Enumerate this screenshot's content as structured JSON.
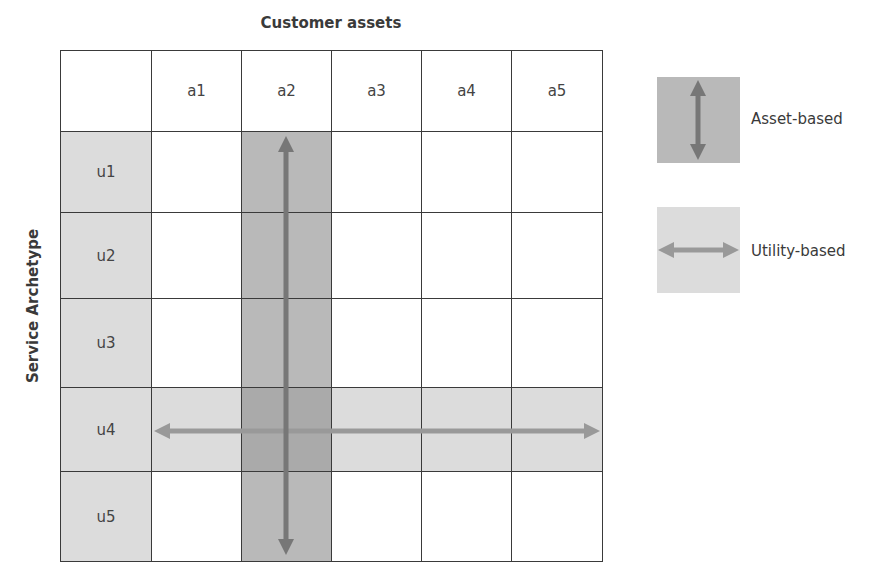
{
  "diagram": {
    "title": "Customer assets",
    "y_axis_label": "Service Archetype",
    "columns": [
      "a1",
      "a2",
      "a3",
      "a4",
      "a5"
    ],
    "rows": [
      "u1",
      "u2",
      "u3",
      "u4",
      "u5"
    ],
    "highlighted_column": "a2",
    "highlighted_row": "u4",
    "colors": {
      "light_fill": "#dcdcdc",
      "dark_fill": "#b9b9b9",
      "overlap_fill": "#aaaaaa",
      "vertical_arrow": "#777777",
      "horizontal_arrow": "#999999",
      "grid_line": "#3a3a3a"
    }
  },
  "legend": {
    "items": [
      {
        "label": "Asset-based",
        "icon": "vertical-double-arrow-icon"
      },
      {
        "label": "Utility-based",
        "icon": "horizontal-double-arrow-icon"
      }
    ]
  }
}
